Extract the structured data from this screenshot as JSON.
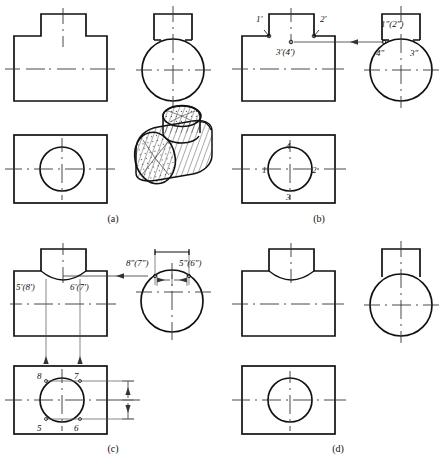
{
  "figure": {
    "panels": [
      {
        "key": "a",
        "caption": "(a)",
        "description": "three views plus pictorial of part"
      },
      {
        "key": "b",
        "caption": "(b)",
        "description": "point labels 1 2 3 4 on flat-top boss"
      },
      {
        "key": "c",
        "caption": "(c)",
        "description": "point labels 5 6 7 8 on curved intersection"
      },
      {
        "key": "d",
        "caption": "(d)",
        "description": "three views with curved intersection, unlabelled"
      }
    ]
  },
  "panel_a": {
    "caption": "(a)",
    "views": [
      "front-view",
      "left-side-view",
      "top-view",
      "pictorial-view"
    ]
  },
  "panel_b": {
    "caption": "(b)",
    "front_view_labels": [
      {
        "id": "b-front-1",
        "text": "1'",
        "x": 32,
        "y": 22
      },
      {
        "id": "b-front-2",
        "text": "2'",
        "x": 96,
        "y": 22
      },
      {
        "id": "b-front-34",
        "text": "3'(4')",
        "x": 52,
        "y": 51
      }
    ],
    "side_view_labels": [
      {
        "id": "b-side-12",
        "text": "1\"(2\")",
        "x": 150,
        "y": 27
      },
      {
        "id": "b-side-4",
        "text": "4\"",
        "x": 146,
        "y": 52
      },
      {
        "id": "b-side-3",
        "text": "3\"",
        "x": 181,
        "y": 52
      }
    ],
    "top_view_labels": [
      {
        "id": "b-top-4",
        "text": "4",
        "x": 61,
        "y": 146
      },
      {
        "id": "b-top-1",
        "text": "1",
        "x": 36,
        "y": 170
      },
      {
        "id": "b-top-2",
        "text": "2",
        "x": 86,
        "y": 170
      },
      {
        "id": "b-top-3",
        "text": "3",
        "x": 61,
        "y": 202
      }
    ]
  },
  "panel_c": {
    "caption": "(c)",
    "front_view_labels": [
      {
        "id": "c-front-58",
        "text": "5'(8')",
        "x": 13,
        "y": 50
      },
      {
        "id": "c-front-67",
        "text": "6'(7')",
        "x": 71,
        "y": 50
      }
    ],
    "side_view_labels": [
      {
        "id": "c-side-87",
        "text": "8\"(7\")",
        "x": 128,
        "y": 28
      },
      {
        "id": "c-side-56",
        "text": "5\"(6\")",
        "x": 181,
        "y": 28
      }
    ],
    "top_view_labels": [
      {
        "id": "c-top-8",
        "text": "8",
        "x": 37,
        "y": 140
      },
      {
        "id": "c-top-7",
        "text": "7",
        "x": 74,
        "y": 140
      },
      {
        "id": "c-top-5",
        "text": "5",
        "x": 37,
        "y": 193
      },
      {
        "id": "c-top-6",
        "text": "6",
        "x": 74,
        "y": 193
      }
    ]
  },
  "panel_d": {
    "caption": "(d)",
    "views": [
      "front-view",
      "side-view",
      "top-view"
    ]
  },
  "style": {
    "line_color": "#111111",
    "thin_line_color": "#555555",
    "center_line_color": "#333333",
    "background": "#ffffff"
  }
}
